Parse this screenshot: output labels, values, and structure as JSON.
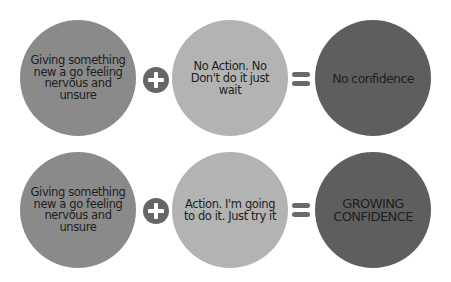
{
  "rows": [
    {
      "start": "Giving something new a go feeling nervous and unsure",
      "action": "No Action. No Don't do it just wait",
      "result": "No confidence"
    },
    {
      "start": "Giving something new a go feeling nervous and unsure",
      "action": "Action. I'm going to do it. Just try it",
      "result": "GROWING CONFIDENCE"
    }
  ],
  "operators": {
    "plus": "plus-icon",
    "equals": "equals-icon"
  },
  "colors": {
    "start_circle": "#8a8a8a",
    "action_circle": "#b3b3b3",
    "result_circle": "#5e5e5e",
    "operator": "#666666",
    "text": "#1e1e1e"
  }
}
